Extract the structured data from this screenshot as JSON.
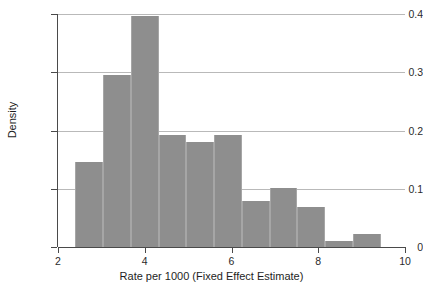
{
  "chart_data": {
    "type": "bar",
    "title": "",
    "subtitle": "",
    "xlabel": "Rate per 1000 (Fixed Effect Estimate)",
    "ylabel": "Density",
    "xlim": [
      2,
      10
    ],
    "ylim": [
      0,
      0.4
    ],
    "grid": "horizontal",
    "legend": "none",
    "bar_color": "#8e8e8e",
    "bin_width": 0.64,
    "bin_edges": [
      2.4,
      3.04,
      3.68,
      4.32,
      4.96,
      5.6,
      6.24,
      6.88,
      7.52,
      8.16,
      8.8,
      9.44
    ],
    "categories": [
      "2.40-3.04",
      "3.04-3.68",
      "3.68-4.32",
      "4.32-4.96",
      "4.96-5.60",
      "5.60-6.24",
      "6.24-6.88",
      "6.88-7.52",
      "7.52-8.16",
      "8.16-8.80",
      "8.80-9.44"
    ],
    "values": [
      0.146,
      0.295,
      0.397,
      0.192,
      0.181,
      0.193,
      0.079,
      0.102,
      0.068,
      0.011,
      0.022
    ],
    "xticks": [
      {
        "value": 2,
        "label": "2"
      },
      {
        "value": 4,
        "label": "4"
      },
      {
        "value": 6,
        "label": "6"
      },
      {
        "value": 8,
        "label": "8"
      },
      {
        "value": 10,
        "label": "10"
      }
    ],
    "yticks": [
      {
        "value": 0,
        "label": "0"
      },
      {
        "value": 0.1,
        "label": "0.1"
      },
      {
        "value": 0.2,
        "label": "0.2"
      },
      {
        "value": 0.3,
        "label": "0.3"
      },
      {
        "value": 0.4,
        "label": "0.4"
      }
    ]
  }
}
